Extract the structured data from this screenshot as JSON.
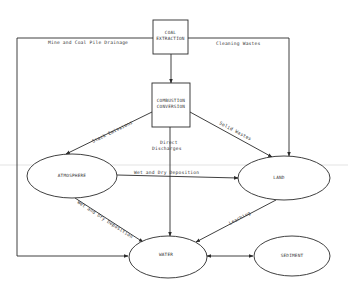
{
  "diagram": {
    "nodes": {
      "coal_extraction": {
        "line1": "COAL",
        "line2": "EXTRACTION",
        "shape": "box"
      },
      "combustion_conversion": {
        "line1": "COMBUSTION",
        "line2": "CONVERSION",
        "shape": "box"
      },
      "atmosphere": {
        "label": "ATMOSPHERE",
        "shape": "ellipse"
      },
      "land": {
        "label": "LAND",
        "shape": "ellipse"
      },
      "water": {
        "label": "WATER",
        "shape": "ellipse"
      },
      "sediment": {
        "label": "SEDIMENT",
        "shape": "ellipse"
      }
    },
    "edges": {
      "mine_drainage": {
        "from": "COAL EXTRACTION",
        "to": "WATER",
        "label": "Mine and Coal Pile Drainage"
      },
      "cleaning_wastes": {
        "from": "COAL EXTRACTION",
        "to": "LAND",
        "label": "Cleaning Wastes"
      },
      "extraction_to_combustion": {
        "from": "COAL EXTRACTION",
        "to": "COMBUSTION CONVERSION",
        "label": ""
      },
      "stack_emissions": {
        "from": "COMBUSTION CONVERSION",
        "to": "ATMOSPHERE",
        "label": "Stack Emissions"
      },
      "solid_wastes": {
        "from": "COMBUSTION CONVERSION",
        "to": "LAND",
        "label": "Solid Wastes"
      },
      "direct_discharges": {
        "from": "COMBUSTION CONVERSION",
        "to": "WATER",
        "label_line1": "Direct",
        "label_line2": "Discharges"
      },
      "atm_to_land": {
        "from": "ATMOSPHERE",
        "to": "LAND",
        "label": "Wet and Dry Deposition"
      },
      "atm_to_water": {
        "from": "ATMOSPHERE",
        "to": "WATER",
        "label": "Wet and Dry Deposition"
      },
      "leaching": {
        "from": "LAND",
        "to": "WATER",
        "label": "Leaching"
      },
      "water_sediment": {
        "from": "WATER",
        "to": "SEDIMENT",
        "label": "",
        "bidirectional": true
      }
    },
    "colors": {
      "line": "#2a2a2a",
      "text": "#333333",
      "background": "#ffffff"
    }
  }
}
